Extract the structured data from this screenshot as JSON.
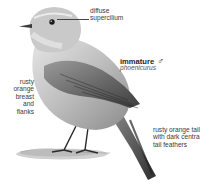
{
  "figure": {
    "title": "immature",
    "sex_symbol": "♂",
    "subtitle": "phoenicurus",
    "annotations": [
      {
        "id": "supercilium",
        "lines": [
          "diffuse",
          "supercilium"
        ]
      },
      {
        "id": "breast",
        "lines": [
          "rusty",
          "orange",
          "breast",
          "and",
          "flanks"
        ]
      },
      {
        "id": "tail",
        "lines": [
          "rusty orange tail",
          "with dark centra",
          "tail feathers"
        ]
      }
    ]
  },
  "colors": {
    "background": "#ffffff",
    "bird_light": "#d9d9d9",
    "bird_mid": "#a6a6a6",
    "bird_dark": "#4a4a4a",
    "text": "#3a3a3a"
  }
}
